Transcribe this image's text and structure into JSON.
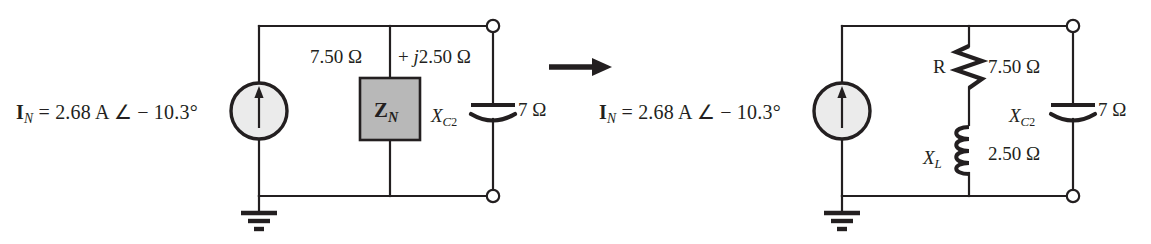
{
  "figure": {
    "type": "circuit-diagram",
    "background_color": "#ffffff",
    "line_color": "#231f20",
    "fill_gray": "#b8b8b8",
    "source_fill": "#ebebeb"
  },
  "transform_arrow": {
    "icon": "right-arrow-icon",
    "direction": "right"
  },
  "left_circuit": {
    "name": "norton-equivalent-block-form",
    "source": {
      "icon": "current-source-icon",
      "label": "I",
      "label_sub": "N",
      "value": "= 2.68 A ∠ − 10.3°",
      "full_label": "I_N  =  2.68 A ∠ − 10.3°"
    },
    "ground": {
      "icon": "ground-icon"
    },
    "impedance_annotation": {
      "real": "7.50 Ω",
      "operator": "+",
      "imaginary_j": "j",
      "imaginary": "2.50 Ω",
      "full": "7.50 Ω + j2.50 Ω"
    },
    "impedance_block": {
      "label": "Z",
      "label_sub": "N",
      "full_label": "Z_N"
    },
    "capacitor": {
      "icon": "capacitor-icon",
      "label": "X",
      "label_sub": "C",
      "label_sub2": "2",
      "value": "7 Ω",
      "full_label": "X_C2  7 Ω"
    },
    "terminals": [
      {
        "name": "terminal-top",
        "icon": "open-terminal-icon"
      },
      {
        "name": "terminal-bottom",
        "icon": "open-terminal-icon"
      }
    ]
  },
  "right_circuit": {
    "name": "norton-equivalent-expanded-form",
    "source": {
      "icon": "current-source-icon",
      "label": "I",
      "label_sub": "N",
      "value": "= 2.68 A ∠ − 10.3°",
      "full_label": "I_N  =  2.68 A ∠ − 10.3°"
    },
    "ground": {
      "icon": "ground-icon"
    },
    "resistor": {
      "icon": "resistor-icon",
      "label": "R",
      "value": "7.50 Ω"
    },
    "inductor": {
      "icon": "inductor-icon",
      "label": "X",
      "label_sub": "L",
      "value": "2.50 Ω",
      "full_label": "X_L  2.50 Ω"
    },
    "capacitor": {
      "icon": "capacitor-icon",
      "label": "X",
      "label_sub": "C",
      "label_sub2": "2",
      "value": "7 Ω",
      "full_label": "X_C2  7 Ω"
    },
    "terminals": [
      {
        "name": "terminal-top",
        "icon": "open-terminal-icon"
      },
      {
        "name": "terminal-bottom",
        "icon": "open-terminal-icon"
      }
    ]
  }
}
